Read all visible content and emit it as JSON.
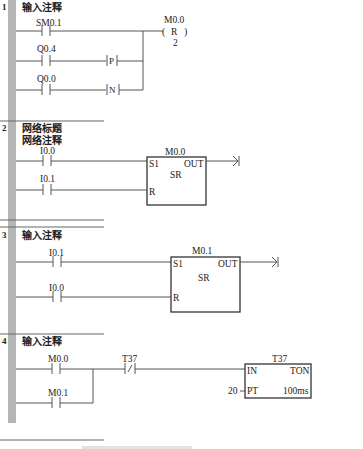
{
  "networks": [
    {
      "number": "1",
      "title": "输入注释",
      "comment": "",
      "contacts": [
        {
          "address": "SM0.1",
          "type": "NO"
        },
        {
          "address": "Q0.4",
          "type": "NO",
          "edge": "P"
        },
        {
          "address": "Q0.0",
          "type": "NO",
          "edge": "N"
        }
      ],
      "coil": {
        "address": "M0.0",
        "op": "R",
        "count": "2"
      }
    },
    {
      "number": "2",
      "title": "网络标题",
      "comment": "网络注释",
      "contacts": [
        {
          "address": "I0.0",
          "type": "NO"
        },
        {
          "address": "I0.1",
          "type": "NO"
        }
      ],
      "block": {
        "address": "M0.0",
        "type": "SR",
        "pin_s": "S1",
        "pin_r": "R",
        "pin_out": "OUT"
      }
    },
    {
      "number": "3",
      "title": "输入注释",
      "comment": "",
      "contacts": [
        {
          "address": "I0.1",
          "type": "NO"
        },
        {
          "address": "I0.0",
          "type": "NO"
        }
      ],
      "block": {
        "address": "M0.1",
        "type": "SR",
        "pin_s": "S1",
        "pin_r": "R",
        "pin_out": "OUT"
      }
    },
    {
      "number": "4",
      "title": "输入注释",
      "comment": "",
      "contacts": [
        {
          "address": "M0.0",
          "type": "NO"
        },
        {
          "address": "M0.1",
          "type": "NO"
        },
        {
          "address": "T37",
          "type": "NC"
        }
      ],
      "timer": {
        "address": "T37",
        "type": "TON",
        "pin_in": "IN",
        "pin_pt": "PT",
        "preset": "20",
        "base": "100ms"
      }
    }
  ],
  "edge_labels": {
    "p": "P",
    "n": "N"
  },
  "caption": "图 — 梯形图（部分截断）"
}
